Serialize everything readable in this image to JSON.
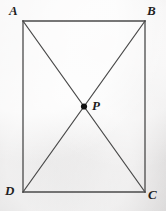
{
  "figure": {
    "name": "rectangle-with-diagonals",
    "background_color": "#eceaea",
    "stroke_color": "#4a4a4a",
    "label_color": "#1f1f1f",
    "point_color": "#111111",
    "stroke_width": 1.3,
    "width": 166,
    "height": 211
  },
  "geometry": {
    "rectangle": {
      "left": 23,
      "right": 145,
      "top": 21,
      "bottom": 192
    },
    "vertices": [
      {
        "id": "A",
        "x": 23,
        "y": 21
      },
      {
        "id": "B",
        "x": 145,
        "y": 21
      },
      {
        "id": "C",
        "x": 145,
        "y": 192
      },
      {
        "id": "D",
        "x": 23,
        "y": 192
      }
    ],
    "diagonals": [
      {
        "from": "A",
        "to": "C"
      },
      {
        "from": "B",
        "to": "D"
      }
    ],
    "intersection": {
      "id": "P",
      "x": 84,
      "y": 106.5,
      "dot_radius": 3.1
    }
  },
  "labels": {
    "a": "A",
    "b": "B",
    "c": "C",
    "d": "D",
    "p": "P"
  }
}
